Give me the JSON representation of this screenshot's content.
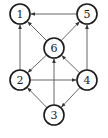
{
  "diagram": {
    "type": "directed-graph",
    "colors": {
      "node_stroke": "#1a1a1a",
      "edge": "#555555",
      "background": "#ffffff"
    },
    "nodes": [
      {
        "id": "1",
        "label": "1",
        "x": 20,
        "y": 14
      },
      {
        "id": "5",
        "label": "5",
        "x": 87,
        "y": 14
      },
      {
        "id": "6",
        "label": "6",
        "x": 54,
        "y": 48
      },
      {
        "id": "2",
        "label": "2",
        "x": 20,
        "y": 80
      },
      {
        "id": "4",
        "label": "4",
        "x": 87,
        "y": 80
      },
      {
        "id": "3",
        "label": "3",
        "x": 54,
        "y": 115
      }
    ],
    "edges": [
      {
        "from": "5",
        "to": "1"
      },
      {
        "from": "6",
        "to": "1"
      },
      {
        "from": "2",
        "to": "1"
      },
      {
        "from": "6",
        "to": "5"
      },
      {
        "from": "4",
        "to": "5"
      },
      {
        "from": "6",
        "to": "2"
      },
      {
        "from": "4",
        "to": "6"
      },
      {
        "from": "3",
        "to": "6"
      },
      {
        "from": "2",
        "to": "4"
      },
      {
        "from": "3",
        "to": "2"
      },
      {
        "from": "4",
        "to": "3"
      }
    ]
  }
}
